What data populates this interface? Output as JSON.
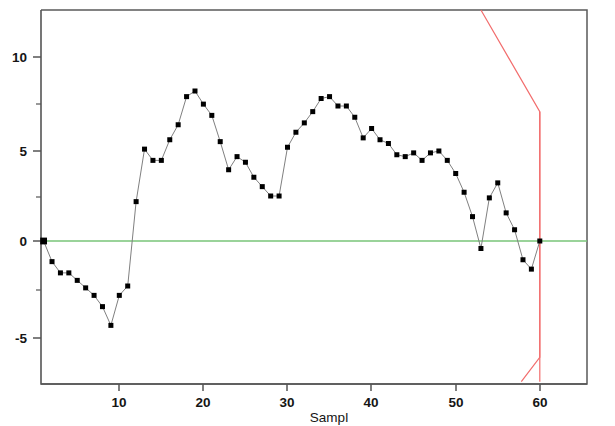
{
  "chart_data": {
    "type": "line",
    "title": "",
    "xlabel": "Sampl",
    "ylabel": "",
    "xlim": [
      0,
      65
    ],
    "ylim": [
      -7.5,
      12.5
    ],
    "grid": false,
    "legend": "none",
    "x_ticks": [
      10,
      20,
      30,
      40,
      50,
      60
    ],
    "x_tick_labels": [
      "10",
      "20",
      "30",
      "40",
      "50",
      "60"
    ],
    "y_ticks": [
      -5,
      0,
      5,
      10
    ],
    "y_tick_labels": [
      "-5",
      "0",
      "5",
      "10"
    ],
    "y_minor_ticks": [
      -2.5,
      2.5,
      7.5
    ],
    "series": [
      {
        "name": "observed",
        "color": "#000000",
        "line_color": "#808080",
        "marker": "square",
        "x": [
          1,
          2,
          3,
          4,
          5,
          6,
          7,
          8,
          9,
          10,
          11,
          12,
          13,
          14,
          15,
          16,
          17,
          18,
          19,
          20,
          21,
          22,
          23,
          24,
          25,
          26,
          27,
          28,
          29,
          30,
          31,
          32,
          33,
          34,
          35,
          36,
          37,
          38,
          39,
          40,
          41,
          42,
          43,
          44,
          45,
          46,
          47,
          48,
          49,
          50,
          51,
          52,
          53,
          54,
          55,
          56,
          57,
          58,
          59,
          60
        ],
        "values": [
          0.0,
          -1.1,
          -1.7,
          -1.7,
          -2.1,
          -2.5,
          -2.9,
          -3.5,
          -4.5,
          -2.9,
          -2.4,
          2.1,
          4.9,
          4.3,
          4.3,
          5.4,
          6.2,
          7.7,
          8.0,
          7.3,
          6.7,
          5.3,
          3.8,
          4.5,
          4.2,
          3.4,
          2.9,
          2.4,
          2.4,
          5.0,
          5.8,
          6.3,
          6.9,
          7.6,
          7.7,
          7.2,
          7.2,
          6.6,
          5.5,
          6.0,
          5.4,
          5.2,
          4.6,
          4.5,
          4.7,
          4.3,
          4.7,
          4.8,
          4.3,
          3.6,
          2.6,
          1.3,
          -0.4,
          2.3,
          3.1,
          1.5,
          0.6,
          -1.0,
          -1.5,
          0.0
        ]
      }
    ],
    "reference_lines": [
      {
        "name": "center-line",
        "color": "#79c579",
        "orientation": "horizontal",
        "value": 0
      }
    ],
    "limit_boundary": {
      "name": "forecast-limits",
      "color": "#f26d6d",
      "upper_path": [
        [
          53.0,
          12.5
        ],
        [
          60.0,
          6.9
        ],
        [
          60.0,
          -7.5
        ]
      ],
      "lower_path": [
        [
          57.8,
          -7.5
        ],
        [
          60.0,
          -6.2
        ],
        [
          60.0,
          6.9
        ]
      ]
    }
  },
  "axes": {
    "x_axis_name": "sample-axis",
    "y_axis_name": "value-axis"
  }
}
